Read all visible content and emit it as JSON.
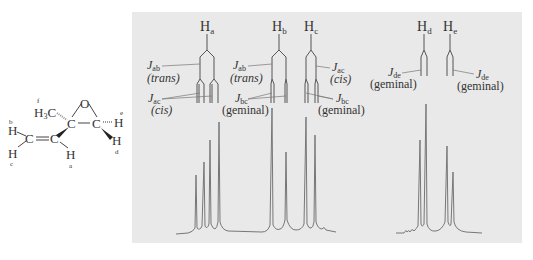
{
  "molecule": {
    "atoms": {
      "O": "O",
      "C_epoxide_left": "C",
      "C_epoxide_right": "C",
      "C_vinyl_left": "C",
      "C_vinyl_right": "C",
      "methyl": "H3C",
      "H_a": "H",
      "H_b": "H",
      "H_c": "H",
      "H_d": "H",
      "H_e": "H"
    },
    "labels": {
      "a": "a",
      "b": "b",
      "c": "c",
      "d": "d",
      "e": "e",
      "f": "f"
    }
  },
  "splitting_trees": [
    {
      "proton": "H",
      "sub": "a",
      "couplings": [
        {
          "J": "J",
          "sub": "ab",
          "type": "(trans)"
        },
        {
          "J": "J",
          "sub": "ac",
          "type": "(cis)"
        }
      ]
    },
    {
      "proton": "H",
      "sub": "b",
      "couplings": [
        {
          "J": "J",
          "sub": "ab",
          "type": "(trans)"
        },
        {
          "J": "J",
          "sub": "bc",
          "type": "(geminal)"
        }
      ]
    },
    {
      "proton": "H",
      "sub": "c",
      "couplings": [
        {
          "J": "J",
          "sub": "ac",
          "type": "(cis)"
        },
        {
          "J": "J",
          "sub": "bc",
          "type": "(geminal)"
        }
      ]
    },
    {
      "proton": "H",
      "sub": "d",
      "couplings": [
        {
          "J": "J",
          "sub": "de",
          "type": "(geminal)"
        }
      ]
    },
    {
      "proton": "H",
      "sub": "e",
      "couplings": [
        {
          "J": "J",
          "sub": "de",
          "type": "(geminal)"
        }
      ]
    }
  ],
  "spectrum": {
    "multiplets": [
      {
        "proton": "Ha",
        "pattern": "doublet of doublets",
        "peak_x": [
          196,
          204,
          210,
          219
        ],
        "peak_top_y": [
          175,
          162,
          140,
          122
        ]
      },
      {
        "proton": "Hb",
        "pattern": "doublet of doublets",
        "peak_x": [
          272,
          286
        ],
        "peak_top_y": [
          108,
          152
        ]
      },
      {
        "proton": "Hc",
        "pattern": "doublet of doublets",
        "peak_x": [
          306,
          315
        ],
        "peak_top_y": [
          117,
          135
        ]
      },
      {
        "proton": "Hd",
        "pattern": "doublet",
        "peak_x": [
          421,
          426
        ],
        "peak_top_y": [
          140,
          104
        ]
      },
      {
        "proton": "He",
        "pattern": "doublet",
        "peak_x": [
          447,
          453
        ],
        "peak_top_y": [
          146,
          172
        ]
      }
    ],
    "baseline_y": 233
  },
  "colors": {
    "panel_bg": "#e9e9e9",
    "line": "#555555",
    "spectrum_line": "#777777",
    "text": "#333333"
  }
}
